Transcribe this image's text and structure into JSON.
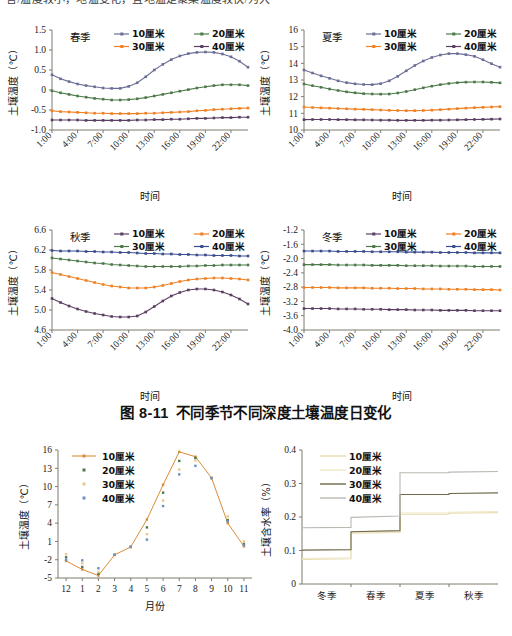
{
  "page": {
    "top_clipped_text": "言/温度较小，地温变化，且地温是聚集温度较快/为大",
    "caption": {
      "number": "图 8-11",
      "text": "不同季节不同深度土壤温度日变化"
    }
  },
  "legend_labels": {
    "d10": "10厘米",
    "d20": "20厘米",
    "d30": "30厘米",
    "d40": "40厘米"
  },
  "colors": {
    "slate": "#6b6f96",
    "green": "#4d7a4a",
    "orange": "#ef8023",
    "purple": "#5a3f63",
    "blue": "#3a4d8f",
    "khaki_light": "#e8dcb0",
    "khaki_pale": "#efe7c6",
    "olive_dark": "#6f6a4a",
    "gray_light": "#b9b9b2",
    "axis": "#7d7d6e"
  },
  "chart_data": [
    {
      "id": "spring",
      "type": "line",
      "title": "春季",
      "xlabel": "时间",
      "ylabel": "土壤温度（℃）",
      "ylim": [
        -1.0,
        1.5
      ],
      "yticks": [
        "-1.0",
        "-0.5",
        "0",
        "0.5",
        "1.0",
        "1.5"
      ],
      "xticks": [
        "1:00",
        "4:00",
        "7:00",
        "10:00",
        "13:00",
        "16:00",
        "19:00",
        "22:00"
      ],
      "x": [
        1,
        2,
        3,
        4,
        5,
        6,
        7,
        8,
        9,
        10,
        11,
        12,
        13,
        14,
        15,
        16,
        17,
        18,
        19,
        20,
        21,
        22,
        23,
        24
      ],
      "legend_order": [
        "10厘米",
        "20厘米",
        "30厘米",
        "40厘米"
      ],
      "legend_colors": [
        "#6b6f96",
        "#4d7a4a",
        "#ef8023",
        "#5a3f63"
      ],
      "series": [
        {
          "name": "10厘米",
          "color": "#6b6f96",
          "values": [
            0.38,
            0.28,
            0.21,
            0.15,
            0.11,
            0.08,
            0.05,
            0.04,
            0.04,
            0.09,
            0.18,
            0.33,
            0.5,
            0.64,
            0.76,
            0.85,
            0.91,
            0.94,
            0.95,
            0.94,
            0.9,
            0.83,
            0.72,
            0.57
          ]
        },
        {
          "name": "20厘米",
          "color": "#4d7a4a",
          "values": [
            -0.02,
            -0.07,
            -0.11,
            -0.15,
            -0.18,
            -0.21,
            -0.23,
            -0.25,
            -0.25,
            -0.24,
            -0.22,
            -0.19,
            -0.15,
            -0.11,
            -0.07,
            -0.03,
            0.01,
            0.05,
            0.08,
            0.11,
            0.13,
            0.13,
            0.13,
            0.11
          ]
        },
        {
          "name": "30厘米",
          "color": "#ef8023",
          "values": [
            -0.52,
            -0.54,
            -0.55,
            -0.56,
            -0.57,
            -0.58,
            -0.58,
            -0.59,
            -0.59,
            -0.59,
            -0.59,
            -0.58,
            -0.58,
            -0.57,
            -0.56,
            -0.55,
            -0.54,
            -0.52,
            -0.51,
            -0.49,
            -0.48,
            -0.47,
            -0.46,
            -0.45
          ]
        },
        {
          "name": "40厘米",
          "color": "#5a3f63",
          "values": [
            -0.75,
            -0.75,
            -0.75,
            -0.75,
            -0.76,
            -0.76,
            -0.76,
            -0.76,
            -0.76,
            -0.76,
            -0.75,
            -0.75,
            -0.74,
            -0.74,
            -0.73,
            -0.73,
            -0.72,
            -0.71,
            -0.71,
            -0.7,
            -0.69,
            -0.69,
            -0.68,
            -0.68
          ]
        }
      ]
    },
    {
      "id": "summer",
      "type": "line",
      "title": "夏季",
      "xlabel": "时间",
      "ylabel": "土壤温度（℃）",
      "ylim": [
        10,
        16
      ],
      "yticks": [
        "10",
        "11",
        "12",
        "13",
        "14",
        "15",
        "16"
      ],
      "xticks": [
        "1:00",
        "4:00",
        "7:00",
        "10:00",
        "13:00",
        "16:00",
        "19:00",
        "22:00"
      ],
      "x": [
        1,
        2,
        3,
        4,
        5,
        6,
        7,
        8,
        9,
        10,
        11,
        12,
        13,
        14,
        15,
        16,
        17,
        18,
        19,
        20,
        21,
        22,
        23,
        24
      ],
      "legend_order": [
        "10厘米",
        "20厘米",
        "30厘米",
        "40厘米"
      ],
      "legend_colors": [
        "#6b6f96",
        "#4d7a4a",
        "#ef8023",
        "#5a3f63"
      ],
      "series": [
        {
          "name": "10厘米",
          "color": "#6b6f96",
          "values": [
            13.6,
            13.42,
            13.25,
            13.1,
            12.95,
            12.84,
            12.77,
            12.73,
            12.72,
            12.78,
            12.95,
            13.22,
            13.55,
            13.87,
            14.14,
            14.35,
            14.5,
            14.58,
            14.58,
            14.52,
            14.42,
            14.22,
            13.98,
            13.77
          ]
        },
        {
          "name": "20厘米",
          "color": "#4d7a4a",
          "values": [
            12.76,
            12.66,
            12.56,
            12.46,
            12.37,
            12.29,
            12.23,
            12.18,
            12.16,
            12.15,
            12.16,
            12.22,
            12.31,
            12.42,
            12.53,
            12.63,
            12.72,
            12.79,
            12.84,
            12.87,
            12.88,
            12.88,
            12.86,
            12.83
          ]
        },
        {
          "name": "30厘米",
          "color": "#ef8023",
          "values": [
            11.38,
            11.35,
            11.33,
            11.31,
            11.29,
            11.27,
            11.25,
            11.24,
            11.22,
            11.2,
            11.18,
            11.17,
            11.16,
            11.16,
            11.17,
            11.19,
            11.22,
            11.25,
            11.28,
            11.31,
            11.34,
            11.36,
            11.38,
            11.4
          ]
        },
        {
          "name": "40厘米",
          "color": "#5a3f63",
          "values": [
            10.62,
            10.63,
            10.63,
            10.63,
            10.62,
            10.62,
            10.61,
            10.61,
            10.6,
            10.59,
            10.59,
            10.58,
            10.58,
            10.58,
            10.58,
            10.59,
            10.59,
            10.6,
            10.61,
            10.62,
            10.63,
            10.64,
            10.65,
            10.66
          ]
        }
      ]
    },
    {
      "id": "autumn",
      "type": "line",
      "title": "秋季",
      "xlabel": "时间",
      "ylabel": "土壤温度（℃）",
      "ylim": [
        4.6,
        6.6
      ],
      "yticks": [
        "4.6",
        "5.0",
        "5.4",
        "5.8",
        "6.2",
        "6.6"
      ],
      "xticks": [
        "1:00",
        "4:00",
        "7:00",
        "10:00",
        "13:00",
        "16:00",
        "19:00",
        "22:00"
      ],
      "x": [
        1,
        2,
        3,
        4,
        5,
        6,
        7,
        8,
        9,
        10,
        11,
        12,
        13,
        14,
        15,
        16,
        17,
        18,
        19,
        20,
        21,
        22,
        23,
        24
      ],
      "legend_order": [
        "10厘米",
        "20厘米",
        "30厘米",
        "40厘米"
      ],
      "legend_colors": [
        "#5a3f63",
        "#ef8023",
        "#4d7a4a",
        "#3a4d8f"
      ],
      "series": [
        {
          "name": "10厘米",
          "color": "#5a3f63",
          "values": [
            5.23,
            5.15,
            5.08,
            5.02,
            4.97,
            4.93,
            4.9,
            4.87,
            4.86,
            4.86,
            4.88,
            4.96,
            5.07,
            5.18,
            5.28,
            5.35,
            5.4,
            5.42,
            5.42,
            5.4,
            5.36,
            5.3,
            5.22,
            5.12
          ]
        },
        {
          "name": "20厘米",
          "color": "#ef8023",
          "values": [
            5.75,
            5.71,
            5.67,
            5.63,
            5.59,
            5.55,
            5.51,
            5.48,
            5.46,
            5.44,
            5.44,
            5.44,
            5.46,
            5.49,
            5.53,
            5.57,
            5.6,
            5.62,
            5.63,
            5.64,
            5.64,
            5.63,
            5.62,
            5.6
          ]
        },
        {
          "name": "30厘米",
          "color": "#4d7a4a",
          "values": [
            6.04,
            6.02,
            6.0,
            5.98,
            5.96,
            5.94,
            5.93,
            5.91,
            5.9,
            5.89,
            5.88,
            5.87,
            5.87,
            5.87,
            5.87,
            5.87,
            5.88,
            5.88,
            5.89,
            5.89,
            5.9,
            5.9,
            5.9,
            5.9
          ]
        },
        {
          "name": "40厘米",
          "color": "#3a4d8f",
          "values": [
            6.19,
            6.18,
            6.18,
            6.18,
            6.17,
            6.17,
            6.16,
            6.16,
            6.15,
            6.15,
            6.14,
            6.13,
            6.13,
            6.12,
            6.12,
            6.11,
            6.11,
            6.1,
            6.1,
            6.09,
            6.09,
            6.09,
            6.08,
            6.08
          ]
        }
      ]
    },
    {
      "id": "winter",
      "type": "line",
      "title": "冬季",
      "xlabel": "时间",
      "ylabel": "土壤温度（℃）",
      "ylim": [
        -4.0,
        -1.2
      ],
      "yticks": [
        "-4.0",
        "-3.6",
        "-3.2",
        "-2.8",
        "-2.4",
        "-2.0",
        "-1.6",
        "-1.2"
      ],
      "xticks": [
        "1:00",
        "4:00",
        "7:00",
        "10:00",
        "13:00",
        "16:00",
        "19:00",
        "22:00"
      ],
      "x": [
        1,
        2,
        3,
        4,
        5,
        6,
        7,
        8,
        9,
        10,
        11,
        12,
        13,
        14,
        15,
        16,
        17,
        18,
        19,
        20,
        21,
        22,
        23,
        24
      ],
      "legend_order": [
        "10厘米",
        "20厘米",
        "30厘米",
        "40厘米"
      ],
      "legend_colors": [
        "#5a3f63",
        "#ef8023",
        "#4d7a4a",
        "#3a4d8f"
      ],
      "series": [
        {
          "name": "10厘米",
          "color": "#5a3f63",
          "values": [
            -3.4,
            -3.4,
            -3.4,
            -3.4,
            -3.41,
            -3.41,
            -3.41,
            -3.42,
            -3.42,
            -3.42,
            -3.43,
            -3.43,
            -3.43,
            -3.44,
            -3.44,
            -3.44,
            -3.45,
            -3.45,
            -3.45,
            -3.45,
            -3.46,
            -3.46,
            -3.46,
            -3.46
          ]
        },
        {
          "name": "20厘米",
          "color": "#ef8023",
          "values": [
            -2.81,
            -2.81,
            -2.81,
            -2.81,
            -2.82,
            -2.82,
            -2.82,
            -2.82,
            -2.83,
            -2.83,
            -2.83,
            -2.84,
            -2.84,
            -2.84,
            -2.85,
            -2.85,
            -2.85,
            -2.86,
            -2.86,
            -2.86,
            -2.87,
            -2.87,
            -2.87,
            -2.88
          ]
        },
        {
          "name": "30厘米",
          "color": "#4d7a4a",
          "values": [
            -2.17,
            -2.17,
            -2.17,
            -2.17,
            -2.18,
            -2.18,
            -2.18,
            -2.18,
            -2.19,
            -2.19,
            -2.19,
            -2.19,
            -2.2,
            -2.2,
            -2.2,
            -2.2,
            -2.21,
            -2.21,
            -2.21,
            -2.21,
            -2.22,
            -2.22,
            -2.22,
            -2.22
          ]
        },
        {
          "name": "40厘米",
          "color": "#3a4d8f",
          "values": [
            -1.79,
            -1.79,
            -1.79,
            -1.79,
            -1.8,
            -1.8,
            -1.8,
            -1.8,
            -1.81,
            -1.81,
            -1.81,
            -1.81,
            -1.82,
            -1.82,
            -1.82,
            -1.82,
            -1.83,
            -1.83,
            -1.83,
            -1.83,
            -1.84,
            -1.84,
            -1.84,
            -1.84
          ]
        }
      ]
    },
    {
      "id": "monthly",
      "type": "scatter",
      "title": "",
      "xlabel": "月份",
      "ylabel": "土壤温度（℃）",
      "ylim": [
        -5,
        16
      ],
      "yticks": [
        "-5",
        "-2",
        "1",
        "4",
        "7",
        "10",
        "13",
        "16"
      ],
      "categories": [
        "12",
        "1",
        "2",
        "3",
        "4",
        "5",
        "6",
        "7",
        "8",
        "9",
        "10",
        "11"
      ],
      "legend_order": [
        "10厘米",
        "20厘米",
        "30厘米",
        "40厘米"
      ],
      "legend_colors": [
        "#d98c3a",
        "#4d7a4a",
        "#e8c888",
        "#6b8fc4"
      ],
      "legend_styles": [
        "line",
        "dot",
        "dot",
        "dot"
      ],
      "series": [
        {
          "name": "10厘米",
          "color": "#d98c3a",
          "style": "line",
          "values": [
            -2.2,
            -3.6,
            -4.6,
            -1.2,
            0.1,
            4.6,
            10.3,
            15.7,
            14.9,
            11.4,
            4.0,
            0.2
          ]
        },
        {
          "name": "20厘米",
          "color": "#4d7a4a",
          "style": "dot",
          "values": [
            -1.6,
            -3.2,
            -4.3,
            -1.2,
            0.1,
            3.3,
            9.0,
            14.2,
            14.7,
            11.4,
            4.5,
            0.6
          ]
        },
        {
          "name": "30厘米",
          "color": "#e8c888",
          "style": "dot",
          "values": [
            -1.1,
            -2.6,
            -4.0,
            -1.2,
            0.1,
            2.2,
            7.7,
            12.8,
            14.3,
            11.4,
            5.1,
            1.0
          ]
        },
        {
          "name": "40厘米",
          "color": "#6b8fc4",
          "style": "dot",
          "values": [
            -2.0,
            -2.1,
            -3.4,
            -1.2,
            0.1,
            1.3,
            6.8,
            12.0,
            13.4,
            11.4,
            4.3,
            0.4
          ]
        }
      ]
    },
    {
      "id": "moisture",
      "type": "line",
      "title": "",
      "xlabel": "",
      "ylabel": "土壤含水率（%）",
      "ylim": [
        0,
        0.4
      ],
      "yticks": [
        "0",
        "0.1",
        "0.2",
        "0.3",
        "0.4"
      ],
      "categories": [
        "冬季",
        "春季",
        "夏季",
        "秋季"
      ],
      "legend_order": [
        "10厘米",
        "20厘米",
        "30厘米",
        "40厘米"
      ],
      "legend_colors": [
        "#e8dcb0",
        "#efe7c6",
        "#6f6a4a",
        "#b9b9b2"
      ],
      "series": [
        {
          "name": "10厘米",
          "color": "#e8dcb0",
          "values": [
            0.073,
            0.152,
            0.208,
            0.211
          ]
        },
        {
          "name": "20厘米",
          "color": "#efe7c6",
          "values": [
            0.076,
            0.155,
            0.212,
            0.214
          ]
        },
        {
          "name": "30厘米",
          "color": "#6f6a4a",
          "values": [
            0.101,
            0.156,
            0.267,
            0.27
          ]
        },
        {
          "name": "40厘米",
          "color": "#b9b9b2",
          "values": [
            0.168,
            0.199,
            0.332,
            0.334
          ]
        }
      ]
    }
  ]
}
